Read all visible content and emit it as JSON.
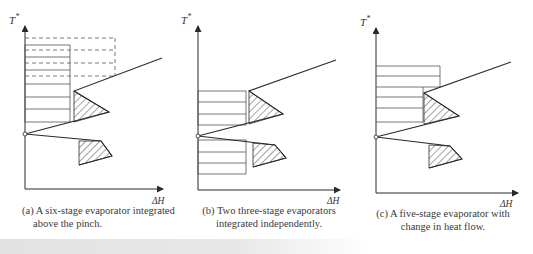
{
  "figure": {
    "axis_labels": {
      "y": "T",
      "y_superscript": "*",
      "x": "ΔH"
    },
    "panels": [
      {
        "id": "a",
        "caption_line1": "(a) A six-stage evaporator integrated",
        "caption_line2": "above the pinch.",
        "stages": 6
      },
      {
        "id": "b",
        "caption_line1": "(b) Two three-stage evaporators",
        "caption_line2": "integrated independently.",
        "stages": "3 + 3"
      },
      {
        "id": "c",
        "caption_line1": "(c) A five-stage evaporator with",
        "caption_line2": "change in heat flow.",
        "stages": 5
      }
    ]
  },
  "colors": {
    "line": "#2a2a2a",
    "stage_line": "#555555",
    "background": "#ffffff"
  }
}
